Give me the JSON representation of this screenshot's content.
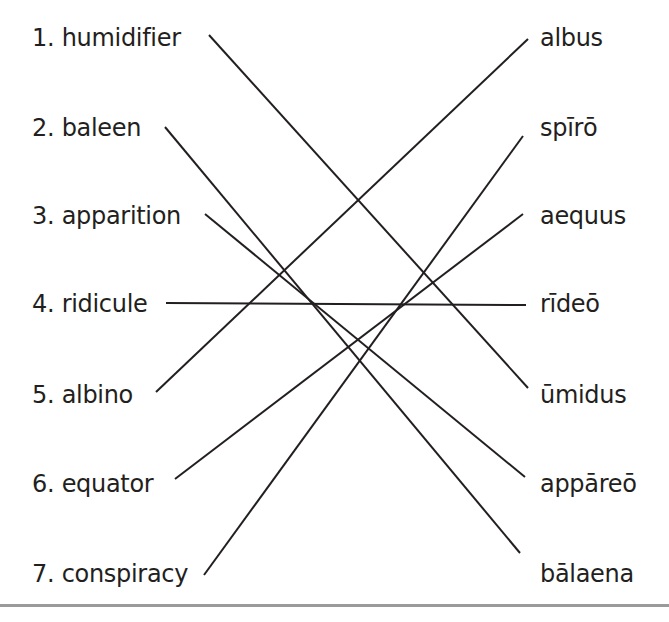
{
  "exercise": {
    "left_terms": [
      {
        "number": "1.",
        "word": "humidifier",
        "label": "1. humidifier"
      },
      {
        "number": "2.",
        "word": "baleen",
        "label": "2. baleen"
      },
      {
        "number": "3.",
        "word": "apparition",
        "label": "3. apparition"
      },
      {
        "number": "4.",
        "word": "ridicule",
        "label": "4. ridicule"
      },
      {
        "number": "5.",
        "word": "albino",
        "label": "5. albino"
      },
      {
        "number": "6.",
        "word": "equator",
        "label": "6. equator"
      },
      {
        "number": "7.",
        "word": "conspiracy",
        "label": "7. conspiracy"
      }
    ],
    "right_terms": [
      "albus",
      "spīrō",
      "aequus",
      "rīdeō",
      "ūmidus",
      "appāreō",
      "bālaena"
    ],
    "matches": [
      {
        "left": "humidifier",
        "right": "ūmidus"
      },
      {
        "left": "baleen",
        "right": "bālaena"
      },
      {
        "left": "apparition",
        "right": "appāreō"
      },
      {
        "left": "ridicule",
        "right": "rīdeō"
      },
      {
        "left": "albino",
        "right": "albus"
      },
      {
        "left": "equator",
        "right": "aequus"
      },
      {
        "left": "conspiracy",
        "right": "spīrō"
      }
    ],
    "line_color": "#231f20",
    "rule_color": "#9a9a9a"
  }
}
